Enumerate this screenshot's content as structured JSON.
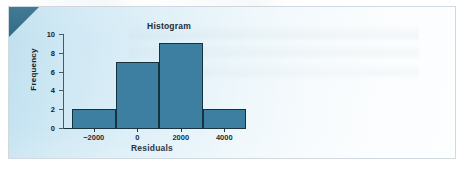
{
  "figure": {
    "corner_decoration": "teal-corner-triangle",
    "panel_color": "#cce6f2",
    "panel_edge_color": "#aab9c4"
  },
  "chart_data": {
    "type": "bar",
    "title": "Histogram",
    "xlabel": "Residuals",
    "ylabel": "Frequency",
    "categories": [
      "-3000 to -1000",
      "-1000 to 1000",
      "1000 to 3000",
      "3000 to 5000"
    ],
    "bin_edges": [
      -3000,
      -1000,
      1000,
      3000,
      5000
    ],
    "values": [
      2,
      7,
      9,
      2
    ],
    "xlim": [
      -3000,
      5000
    ],
    "ylim": [
      0,
      10
    ],
    "xticks": [
      -2000,
      0,
      2000,
      4000
    ],
    "xtick_labels": [
      "−2000",
      "0",
      "2000",
      "4000"
    ],
    "yticks": [
      0,
      2,
      4,
      6,
      8,
      10
    ],
    "ytick_labels": [
      "0",
      "2",
      "4",
      "6",
      "8",
      "10"
    ],
    "grid": false,
    "legend": false,
    "bar_fill_color": "#3d7fa0",
    "bar_edge_color": "#17313f"
  }
}
